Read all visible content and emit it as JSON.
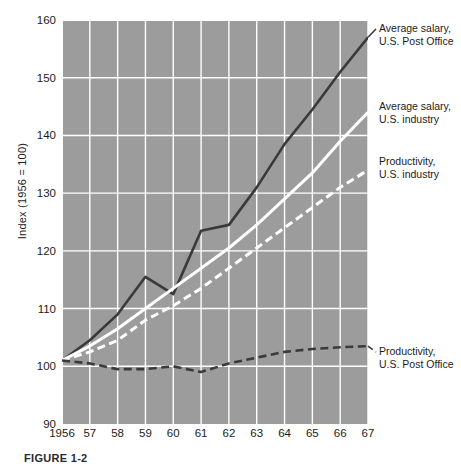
{
  "figure": {
    "caption": "FIGURE 1-2",
    "background_color": "#9c9c9c",
    "grid_color": "#ffffff"
  },
  "axes": {
    "ylabel": "Index (1956 = 100)",
    "yticks": [
      90,
      100,
      110,
      120,
      130,
      140,
      150,
      160
    ],
    "ylim": [
      90,
      160
    ],
    "xticks": [
      "1956",
      "57",
      "58",
      "59",
      "60",
      "61",
      "62",
      "63",
      "64",
      "65",
      "66",
      "67"
    ],
    "xlim": [
      1956,
      1967
    ]
  },
  "annotations": [
    {
      "name": "average-salary-post-office",
      "text": "Average salary,\nU.S. Post Office"
    },
    {
      "name": "average-salary-industry",
      "text": "Average salary,\nU.S. industry"
    },
    {
      "name": "productivity-industry",
      "text": "Productivity,\nU.S. industry"
    },
    {
      "name": "productivity-post-office",
      "text": "Productivity,\nU.S. Post Office"
    }
  ],
  "chart_data": {
    "type": "line",
    "title": "",
    "xlabel": "",
    "ylabel": "Index (1956 = 100)",
    "ylim": [
      90,
      160
    ],
    "grid": true,
    "legend_position": "right-inline-annotations",
    "x": [
      1956,
      1957,
      1958,
      1959,
      1960,
      1961,
      1962,
      1963,
      1964,
      1965,
      1966,
      1967
    ],
    "xticklabels": [
      "1956",
      "57",
      "58",
      "59",
      "60",
      "61",
      "62",
      "63",
      "64",
      "65",
      "66",
      "67"
    ],
    "series": [
      {
        "name": "Average salary, U.S. Post Office",
        "color": "#3a3a3a",
        "style": "solid",
        "values": [
          101,
          104.5,
          109,
          115.5,
          112.5,
          123.5,
          124.5,
          131,
          138.5,
          144.5,
          151,
          157
        ]
      },
      {
        "name": "Average salary, U.S. industry",
        "color": "#ffffff",
        "style": "solid",
        "values": [
          101,
          103.5,
          106.5,
          110,
          113.5,
          117,
          120.5,
          124.5,
          129,
          133.5,
          139,
          144
        ]
      },
      {
        "name": "Productivity, U.S. industry",
        "color": "#ffffff",
        "style": "dashed",
        "values": [
          101,
          102.5,
          104.5,
          108,
          110.5,
          113.5,
          117,
          120.5,
          124,
          127.5,
          131,
          134
        ]
      },
      {
        "name": "Productivity, U.S. Post Office",
        "color": "#3a3a3a",
        "style": "dashed",
        "values": [
          101,
          100.5,
          99.5,
          99.5,
          100,
          99,
          100.5,
          101.5,
          102.5,
          103,
          103.3,
          103.5
        ]
      }
    ]
  }
}
